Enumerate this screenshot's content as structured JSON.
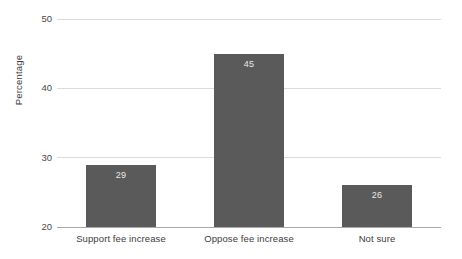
{
  "chart_data": {
    "type": "bar",
    "title": "",
    "subtitle": "",
    "xlabel": "",
    "ylabel": "Percentage",
    "categories": [
      "Support fee increase",
      "Oppose fee increase",
      "Not sure"
    ],
    "values": [
      29,
      45,
      26
    ],
    "value_labels": [
      "29",
      "45",
      "26"
    ],
    "ylim": [
      20,
      50
    ],
    "yticks": [
      20,
      30,
      40,
      50
    ],
    "ytick_labels": [
      "20",
      "30",
      "40",
      "50"
    ],
    "grid": "horizontal",
    "legend": "none",
    "orientation": "vertical",
    "colors": {
      "bar_fill": "#5a5a5a",
      "gridline": "#dcdcdc",
      "axis_line": "#a8a8a8",
      "value_label": "#e9e9e9",
      "tick_text": "#4a4a4a",
      "background": "#ffffff"
    }
  }
}
